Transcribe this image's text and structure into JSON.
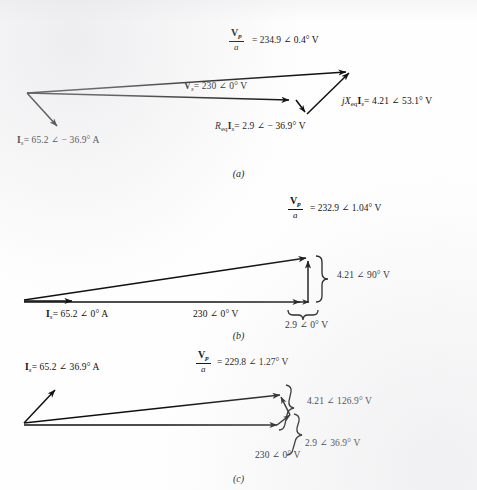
{
  "document": {
    "type": "phasor-diagram-figure",
    "figure_count": 3,
    "background_color": "#fefefe",
    "ink_color": "#111111"
  },
  "symbols": {
    "angle": "∠",
    "degree": "°",
    "equals": "=",
    "minus": "−"
  },
  "figures": [
    {
      "caption": "(a)",
      "condition": "lagging power factor",
      "labels": {
        "vp_over_a": {
          "numerator": "V",
          "numerator_sub": "p",
          "denominator": "a",
          "value": "= 234.9 ∠ 0.4° V",
          "magnitude": 234.9,
          "angle_deg": 0.4,
          "unit": "V"
        },
        "vs": {
          "symbol": "V",
          "sub": "s",
          "value": "= 230 ∠ 0° V",
          "magnitude": 230,
          "angle_deg": 0,
          "unit": "V"
        },
        "req_is": {
          "symbol": "R",
          "sub": "eq",
          "symbol2": "I",
          "sub2": "s",
          "value": "= 2.9 ∠ − 36.9° V",
          "magnitude": 2.9,
          "angle_deg": -36.9,
          "unit": "V"
        },
        "jx_is": {
          "symbol": "jX",
          "sub": "eq",
          "symbol2": "I",
          "sub2": "s",
          "value": "= 4.21 ∠ 53.1° V",
          "magnitude": 4.21,
          "angle_deg": 53.1,
          "unit": "V"
        },
        "is": {
          "symbol": "I",
          "sub": "s",
          "value": "= 65.2 ∠ − 36.9° A",
          "magnitude": 65.2,
          "angle_deg": -36.9,
          "unit": "A"
        }
      }
    },
    {
      "caption": "(b)",
      "condition": "unity power factor",
      "labels": {
        "vp_over_a": {
          "numerator": "V",
          "numerator_sub": "p",
          "denominator": "a",
          "value": "= 232.9 ∠ 1.04° V",
          "magnitude": 232.9,
          "angle_deg": 1.04,
          "unit": "V"
        },
        "is": {
          "symbol": "I",
          "sub": "s",
          "value": "= 65.2 ∠ 0° A",
          "magnitude": 65.2,
          "angle_deg": 0,
          "unit": "A"
        },
        "vs": {
          "value": "230 ∠ 0° V",
          "magnitude": 230,
          "angle_deg": 0,
          "unit": "V"
        },
        "jx_is": {
          "value": "4.21 ∠ 90° V",
          "magnitude": 4.21,
          "angle_deg": 90,
          "unit": "V"
        },
        "req_is": {
          "value": "2.9 ∠ 0° V",
          "magnitude": 2.9,
          "angle_deg": 0,
          "unit": "V"
        }
      }
    },
    {
      "caption": "(c)",
      "condition": "leading power factor",
      "labels": {
        "is": {
          "symbol": "I",
          "sub": "s",
          "value": "= 65.2 ∠ 36.9° A",
          "magnitude": 65.2,
          "angle_deg": 36.9,
          "unit": "A"
        },
        "vp_over_a": {
          "numerator": "V",
          "numerator_sub": "p",
          "denominator": "a",
          "value": "= 229.8 ∠ 1.27° V",
          "magnitude": 229.8,
          "angle_deg": 1.27,
          "unit": "V"
        },
        "jx_is": {
          "value": "4.21 ∠ 126.9° V",
          "magnitude": 4.21,
          "angle_deg": 126.9,
          "unit": "V"
        },
        "req_is": {
          "value": "2.9 ∠ 36.9° V",
          "magnitude": 2.9,
          "angle_deg": 36.9,
          "unit": "V"
        },
        "vs": {
          "value": "230 ∠ 0° V",
          "magnitude": 230,
          "angle_deg": 0,
          "unit": "V"
        }
      }
    }
  ]
}
